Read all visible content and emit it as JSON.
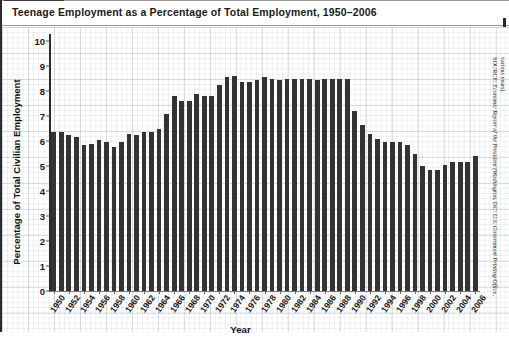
{
  "figure": {
    "title": "Teenage Employment as a Percentage of Total Employment, 1950–2006"
  },
  "axes": {
    "ylabel": "Percentage of Total Civilian Employment",
    "xlabel": "Year",
    "yticks": [
      "0",
      "1",
      "2",
      "3",
      "4",
      "5",
      "6",
      "7",
      "8",
      "9",
      "10"
    ]
  },
  "source": {
    "line1_prefix": "SOURCE: ",
    "line1": "Economic Report of the President (Washington, DC: U.S. Government Printing Office,",
    "line2": "various years)."
  },
  "colors": {
    "bar": "#333333",
    "axis": "#2b2b2b",
    "grid": "#96a0af",
    "text": "#1a1a1a",
    "background": "#ffffff"
  },
  "chart_data": {
    "type": "bar",
    "title": "Teenage Employment as a Percentage of Total Employment, 1950–2006",
    "xlabel": "Year",
    "ylabel": "Percentage of Total Civilian Employment",
    "ylim": [
      0,
      10
    ],
    "ytick_step": 1,
    "grid": true,
    "legend": "none",
    "xtick_labels": [
      "1950",
      "1952",
      "1954",
      "1956",
      "1958",
      "1960",
      "1962",
      "1964",
      "1966",
      "1968",
      "1970",
      "1972",
      "1974",
      "1976",
      "1978",
      "1980",
      "1982",
      "1984",
      "1986",
      "1988",
      "1990",
      "1992",
      "1994",
      "1996",
      "1998",
      "2000",
      "2002",
      "2004",
      "2006"
    ],
    "categories": [
      "1950",
      "1951",
      "1952",
      "1953",
      "1954",
      "1955",
      "1956",
      "1957",
      "1958",
      "1959",
      "1960",
      "1961",
      "1962",
      "1963",
      "1964",
      "1965",
      "1966",
      "1967",
      "1968",
      "1969",
      "1970",
      "1971",
      "1972",
      "1973",
      "1974",
      "1975",
      "1976",
      "1977",
      "1978",
      "1979",
      "1980",
      "1981",
      "1982",
      "1983",
      "1984",
      "1985",
      "1986",
      "1987",
      "1988",
      "1989",
      "1990",
      "1991",
      "1992",
      "1993",
      "1994",
      "1995",
      "1996",
      "1997",
      "1998",
      "1999",
      "2000",
      "2001",
      "2002",
      "2003",
      "2004",
      "2005",
      "2006"
    ],
    "values": [
      6.35,
      6.35,
      6.25,
      6.15,
      5.85,
      5.9,
      6.05,
      5.95,
      5.75,
      5.95,
      6.3,
      6.25,
      6.35,
      6.35,
      6.5,
      7.1,
      7.8,
      7.6,
      7.6,
      7.9,
      7.8,
      7.8,
      8.25,
      8.55,
      8.6,
      8.35,
      8.35,
      8.45,
      8.55,
      8.5,
      8.45,
      8.5,
      8.5,
      8.5,
      8.5,
      8.45,
      8.5,
      8.5,
      8.5,
      8.5,
      7.2,
      6.65,
      6.3,
      6.1,
      5.95,
      5.95,
      5.95,
      5.85,
      5.5,
      5.0,
      4.85,
      4.85,
      5.05,
      5.15,
      5.15,
      5.15,
      5.4
    ]
  }
}
